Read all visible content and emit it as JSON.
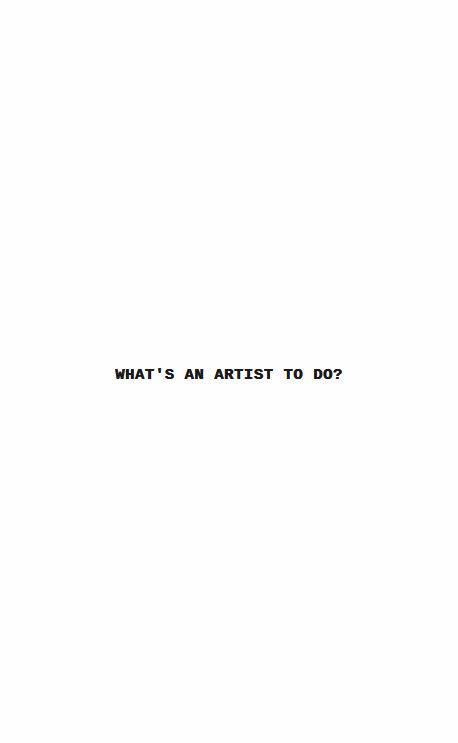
{
  "page": {
    "title": "WHAT'S AN ARTIST TO DO?",
    "background_color": "#fefefe",
    "text_color": "#1a1a1a"
  }
}
